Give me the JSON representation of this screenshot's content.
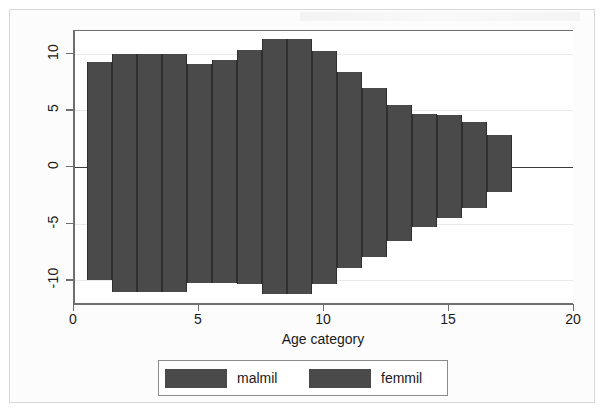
{
  "chart_data": {
    "type": "bar",
    "title": "",
    "subtitle": "",
    "xlabel": "Age category",
    "ylabel": "t",
    "xlim": [
      0,
      20
    ],
    "ylim": [
      -12,
      12
    ],
    "xticks": [
      0,
      5,
      10,
      15,
      20
    ],
    "xtick_labels": [
      "0",
      "5",
      "10",
      "15",
      "20"
    ],
    "yticks": [
      10,
      5,
      0,
      -5,
      -10
    ],
    "ytick_labels": [
      "10",
      "5",
      "0",
      "-5",
      "-10"
    ],
    "grid": true,
    "legend_position": "bottom",
    "orientation": "population-pyramid",
    "bar_width": 1,
    "categories": [
      1,
      2,
      3,
      4,
      5,
      6,
      7,
      8,
      9,
      10,
      11,
      12,
      13,
      14,
      15,
      16,
      17
    ],
    "series": [
      {
        "name": "malmil",
        "color": "#4a4a4a",
        "values": [
          9.3,
          10.0,
          10.0,
          10.0,
          9.1,
          9.4,
          10.3,
          11.3,
          11.3,
          10.2,
          8.4,
          7.0,
          5.5,
          4.7,
          4.6,
          4.0,
          2.8
        ]
      },
      {
        "name": "femmil",
        "color": "#4a4a4a",
        "values": [
          -10.0,
          -11.0,
          -11.0,
          -11.0,
          -10.2,
          -10.2,
          -10.3,
          -11.2,
          -11.2,
          -10.3,
          -8.9,
          -7.9,
          -6.5,
          -5.3,
          -4.5,
          -3.6,
          -2.2
        ]
      }
    ]
  },
  "axes": {
    "x_title": "Age category",
    "y_title": "t"
  },
  "legend": {
    "items": [
      {
        "label": "malmil",
        "color": "#4a4a4a"
      },
      {
        "label": "femmil",
        "color": "#4a4a4a"
      }
    ]
  },
  "colors": {
    "bar_fill": "#4a4a4a",
    "axis": "#6e6e6e",
    "grid": "#e9e9e9",
    "zero_line": "#3b3b3b",
    "background": "#ffffff",
    "frame": "#d8d8d8",
    "text": "#1a1a1a"
  }
}
